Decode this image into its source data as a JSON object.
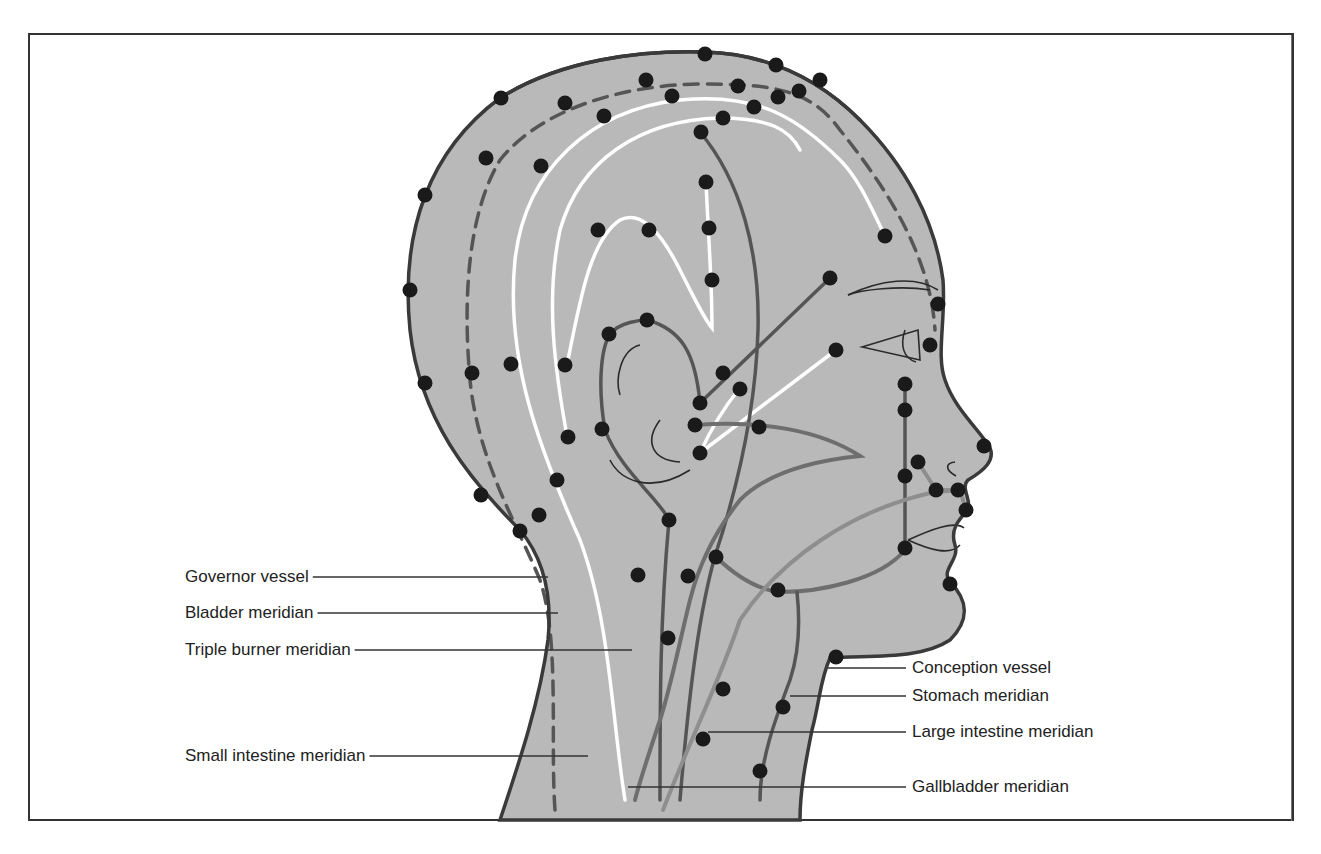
{
  "figure": {
    "type": "acupuncture meridian head diagram (lateral view)",
    "colors": {
      "skin": "#b9b9b9",
      "outline": "#3a3a3a",
      "meridian_dark": "#555555",
      "meridian_mid": "#6e6e6e",
      "meridian_light": "#8e8e8e",
      "meridian_white": "#ffffff",
      "point": "#1a1a1a",
      "leader": "#333333"
    }
  },
  "labels": {
    "left": [
      {
        "id": "governor",
        "text": "Governor vessel",
        "x": 185,
        "y": 567,
        "line_to": [
          548,
          577
        ]
      },
      {
        "id": "bladder",
        "text": "Bladder meridian",
        "x": 185,
        "y": 603,
        "line_to": [
          558,
          613
        ]
      },
      {
        "id": "triple_burner",
        "text": "Triple burner meridian",
        "x": 185,
        "y": 640,
        "line_to": [
          632,
          650
        ]
      },
      {
        "id": "small_intestine",
        "text": "Small intestine meridian",
        "x": 185,
        "y": 746,
        "line_to": [
          588,
          756
        ]
      }
    ],
    "right": [
      {
        "id": "conception",
        "text": "Conception vessel",
        "x": 912,
        "y": 658,
        "line_from": [
          828,
          668
        ]
      },
      {
        "id": "stomach",
        "text": "Stomach meridian",
        "x": 912,
        "y": 686,
        "line_from": [
          790,
          696
        ]
      },
      {
        "id": "large_intestine",
        "text": "Large intestine meridian",
        "x": 912,
        "y": 722,
        "line_from": [
          708,
          732
        ]
      },
      {
        "id": "gallbladder",
        "text": "Gallbladder meridian",
        "x": 912,
        "y": 777,
        "line_from": [
          628,
          787
        ]
      }
    ]
  },
  "head_outline": "M 500 820 C 520 760 540 700 548 640 C 552 600 545 560 520 530 C 470 480 420 420 410 330 C 400 230 430 150 500 98 C 560 60 640 50 705 52 C 770 54 820 80 860 120 C 905 165 935 220 943 280 C 946 320 936 355 945 380 C 955 410 980 430 990 448 C 995 460 985 470 968 480 C 960 488 972 500 968 510 C 958 520 950 530 955 545 C 960 560 940 570 950 582 C 968 600 970 620 950 640 C 920 660 870 655 830 658 C 820 680 820 700 812 730 C 806 760 800 790 800 820 Z",
  "meridians": [
    {
      "name": "governor-vessel",
      "style": "outline",
      "d": "M 500 98 C 560 60 640 50 705 52 C 770 54 820 80 860 120"
    },
    {
      "name": "bladder-meridian",
      "style": "dashed",
      "d": "M 555 810 C 550 740 560 640 540 580 C 515 520 478 460 470 380 C 462 290 470 210 500 160 C 540 110 620 85 700 84 C 770 84 810 88 840 130 C 880 180 930 250 935 330"
    },
    {
      "name": "triple-burner-outer-white",
      "style": "white",
      "d": "M 625 800 C 612 720 610 620 580 540 C 540 450 505 360 515 260 C 525 170 590 110 680 100 C 760 92 800 120 840 160 C 860 180 872 210 885 236"
    },
    {
      "name": "triple-burner-inner-white",
      "style": "white",
      "d": "M 567 436 C 555 370 545 300 560 230 C 580 160 640 120 720 118 C 770 118 790 130 800 150"
    },
    {
      "name": "small-white-loop",
      "style": "white",
      "d": "M 567 365 C 580 300 590 240 620 220 C 640 210 660 230 680 270 C 695 300 705 320 712 328 C 712 280 708 230 706 182"
    },
    {
      "name": "ear-to-face-white-1",
      "style": "white",
      "d": "M 700 453 L 836 350"
    },
    {
      "name": "ear-to-face-white-2",
      "style": "white",
      "d": "M 700 453 C 715 420 730 400 740 388"
    },
    {
      "name": "temple-dark-line",
      "style": "dark",
      "d": "M 700 132 C 740 180 760 250 758 330 C 756 400 740 480 715 556 C 700 610 690 680 680 800"
    },
    {
      "name": "ear-outer-dark",
      "style": "dark",
      "d": "M 660 800 C 660 700 660 620 669 520 C 660 500 620 470 605 430 C 598 390 600 350 610 334 C 620 322 640 320 648 320 C 680 330 695 350 700 403"
    },
    {
      "name": "zygoma-dark",
      "style": "dark",
      "d": "M 700 403 L 830 278"
    },
    {
      "name": "cheek-mid",
      "style": "mid",
      "d": "M 695 425 C 760 420 820 430 860 456 C 820 460 770 470 740 500 C 720 525 700 560 690 600 C 680 640 670 690 660 720 C 650 750 640 780 635 800"
    },
    {
      "name": "jaw-mid",
      "style": "mid",
      "d": "M 716 557 C 740 580 760 590 780 592 C 820 592 880 580 905 550"
    },
    {
      "name": "stomach-meridian",
      "style": "dark",
      "d": "M 905 550 L 905 385 M 760 800 C 760 760 775 720 790 680 C 800 650 800 620 797 592"
    },
    {
      "name": "large-intestine-meridian",
      "style": "light",
      "d": "M 663 810 C 690 740 720 680 740 620 C 780 560 850 510 935 492 L 960 490"
    },
    {
      "name": "face-small-links",
      "style": "light",
      "d": "M 918 462 L 936 490 L 960 490 L 966 510"
    }
  ],
  "face_lines": [
    "M 848 295 C 880 280 915 275 938 290",
    "M 848 295 C 860 290 900 285 930 290",
    "M 862 347 L 918 330 L 920 360 Z",
    "M 905 330 C 900 345 903 358 916 362",
    "M 956 476 C 945 470 945 463 955 462",
    "M 908 540 C 930 530 955 520 964 528",
    "M 908 540 C 930 550 950 556 960 545",
    "M 640 345 C 620 350 615 380 620 395",
    "M 660 420 C 645 440 650 460 680 462",
    "M 610 460 C 620 480 650 495 690 470"
  ],
  "points": [
    [
      705,
      54
    ],
    [
      776,
      65
    ],
    [
      820,
      80
    ],
    [
      799,
      91
    ],
    [
      778,
      97
    ],
    [
      738,
      86
    ],
    [
      646,
      80
    ],
    [
      565,
      103
    ],
    [
      501,
      98
    ],
    [
      486,
      158
    ],
    [
      425,
      195
    ],
    [
      410,
      290
    ],
    [
      425,
      383
    ],
    [
      481,
      495
    ],
    [
      520,
      531
    ],
    [
      539,
      515
    ],
    [
      672,
      96
    ],
    [
      604,
      116
    ],
    [
      754,
      107
    ],
    [
      723,
      118
    ],
    [
      701,
      132
    ],
    [
      541,
      166
    ],
    [
      706,
      182
    ],
    [
      598,
      230
    ],
    [
      649,
      230
    ],
    [
      709,
      228
    ],
    [
      712,
      280
    ],
    [
      885,
      236
    ],
    [
      830,
      278
    ],
    [
      938,
      304
    ],
    [
      930,
      345
    ],
    [
      836,
      350
    ],
    [
      609,
      334
    ],
    [
      647,
      320
    ],
    [
      511,
      364
    ],
    [
      565,
      365
    ],
    [
      472,
      373
    ],
    [
      568,
      437
    ],
    [
      602,
      429
    ],
    [
      557,
      480
    ],
    [
      723,
      373
    ],
    [
      740,
      389
    ],
    [
      700,
      403
    ],
    [
      695,
      425
    ],
    [
      700,
      453
    ],
    [
      759,
      427
    ],
    [
      905,
      384
    ],
    [
      905,
      410
    ],
    [
      984,
      446
    ],
    [
      918,
      462
    ],
    [
      905,
      476
    ],
    [
      936,
      490
    ],
    [
      958,
      490
    ],
    [
      966,
      510
    ],
    [
      905,
      548
    ],
    [
      950,
      584
    ],
    [
      669,
      520
    ],
    [
      716,
      557
    ],
    [
      688,
      576
    ],
    [
      638,
      575
    ],
    [
      778,
      590
    ],
    [
      668,
      638
    ],
    [
      836,
      657
    ],
    [
      723,
      689
    ],
    [
      783,
      707
    ],
    [
      703,
      739
    ],
    [
      760,
      771
    ]
  ]
}
